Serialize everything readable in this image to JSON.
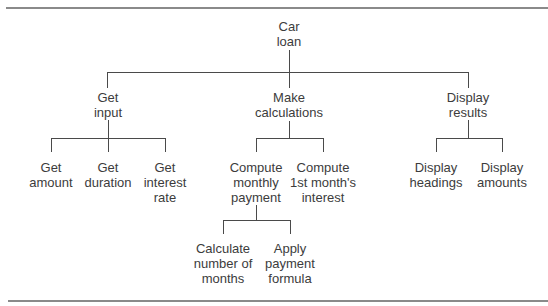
{
  "diagram": {
    "type": "hierarchy-chart",
    "root": {
      "lines": [
        "Car",
        "loan"
      ],
      "children": [
        {
          "lines": [
            "Get",
            "input"
          ],
          "children": [
            {
              "lines": [
                "Get",
                "amount"
              ]
            },
            {
              "lines": [
                "Get",
                "duration"
              ]
            },
            {
              "lines": [
                "Get",
                "interest",
                "rate"
              ]
            }
          ]
        },
        {
          "lines": [
            "Make",
            "calculations"
          ],
          "children": [
            {
              "lines": [
                "Compute",
                "monthly",
                "payment"
              ],
              "children": [
                {
                  "lines": [
                    "Calculate",
                    "number of",
                    "months"
                  ]
                },
                {
                  "lines": [
                    "Apply",
                    "payment",
                    "formula"
                  ]
                }
              ]
            },
            {
              "lines": [
                "Compute",
                "1st month's",
                "interest"
              ]
            }
          ]
        },
        {
          "lines": [
            "Display",
            "results"
          ],
          "children": [
            {
              "lines": [
                "Display",
                "headings"
              ]
            },
            {
              "lines": [
                "Display",
                "amounts"
              ]
            }
          ]
        }
      ]
    }
  },
  "colors": {
    "line": "#4a4a4a",
    "text": "#3c3c3c",
    "rule": "#8a8a8a",
    "background": "#ffffff"
  }
}
